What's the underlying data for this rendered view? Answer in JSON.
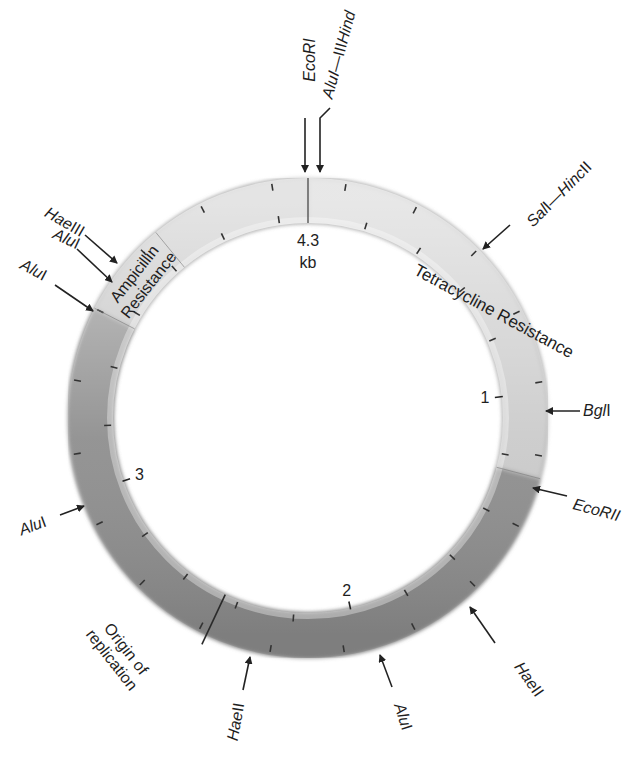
{
  "diagram": {
    "type": "plasmid-restriction-map",
    "center": {
      "x": 308,
      "y": 418
    },
    "outer_radius": 240,
    "inner_radius": 195,
    "total_size_kb": 4.3,
    "size_label": {
      "value": "4.3",
      "unit": "kb"
    },
    "scale_labels": [
      {
        "text": "1",
        "kb": 1
      },
      {
        "text": "2",
        "kb": 2
      },
      {
        "text": "3",
        "kb": 3
      }
    ],
    "regions": [
      {
        "name": "Tetracycline Resistance",
        "line1": "Tetracycline Resistance",
        "start_kb": 0.0,
        "end_kb": 1.25,
        "color": "#c9c9c9"
      },
      {
        "name": "Origin of replication",
        "line1": "Origin of",
        "line2": "replication",
        "position_kb": 2.45
      },
      {
        "name": "Ampicillin Resistance",
        "line1": "Ampicillin",
        "line2": "Resistance",
        "start_kb": 3.65,
        "end_kb": 3.85,
        "color": "#bdbdbd"
      }
    ],
    "ring_colors": {
      "light": "#cfcfcf",
      "dark": "#8c8c8c",
      "tick": "#333333"
    },
    "sites": [
      {
        "label": "EcoRI",
        "enzyme": "EcoRI",
        "suffix": "",
        "position_kb": 0.0
      },
      {
        "label": "AluI—HindIII",
        "enzyme": "AluI—",
        "enzyme2": "Hind",
        "suffix": "III",
        "position_kb": 0.03
      },
      {
        "label": "SalI—HincII",
        "enzyme": "Sal",
        "suffix": "I—",
        "enzyme2": "Hinc",
        "suffix2": "II",
        "position_kb": 0.65
      },
      {
        "label": "BglI",
        "enzyme": "Bgl",
        "suffix": "I",
        "position_kb": 1.1
      },
      {
        "label": "EcoRII",
        "enzyme": "EcoRII",
        "suffix": "",
        "position_kb": 1.3
      },
      {
        "label": "HaeII",
        "enzyme": "Hae",
        "suffix": "II",
        "position_kb": 1.7
      },
      {
        "label": "AluI",
        "enzyme": "Alu",
        "suffix": "I",
        "position_kb": 1.92
      },
      {
        "label": "HaeII",
        "enzyme": "Hae",
        "suffix": "II",
        "position_kb": 2.25
      },
      {
        "label": "AluI",
        "enzyme": "Alu",
        "suffix": "I",
        "position_kb": 2.8
      },
      {
        "label": "AluI",
        "enzyme": "Alu",
        "suffix": "I",
        "position_kb": 3.6
      },
      {
        "label": "AluI",
        "enzyme": "Alu",
        "suffix": "I",
        "position_kb": 3.72
      },
      {
        "label": "HaeIII",
        "enzyme": "Hae",
        "suffix": "III",
        "position_kb": 3.78
      }
    ]
  }
}
